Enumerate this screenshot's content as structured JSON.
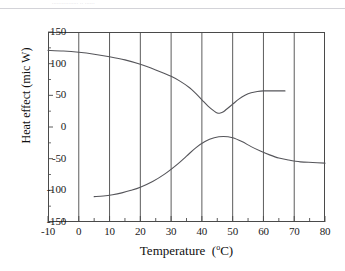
{
  "figure": {
    "scan_artifact_text": "................ ..  ......",
    "background_color": "#ffffff",
    "line_color": "#55555a",
    "axis_color": "#4a4a4a"
  },
  "chart_data": {
    "type": "line",
    "title": "",
    "xlabel_text": "Temperature",
    "xlabel_unit": "(oC)",
    "xlabel": "Temperature  (oC)",
    "ylabel": "Heat effect (mic W)",
    "xlim": [
      -10,
      80
    ],
    "ylim": [
      -150,
      150
    ],
    "xticks": [
      -10,
      0,
      10,
      20,
      30,
      40,
      50,
      60,
      70,
      80
    ],
    "xtick_labels": [
      "-10",
      "0",
      "10",
      "20",
      "30",
      "40",
      "50",
      "60",
      "70",
      "80"
    ],
    "yticks": [
      -150,
      -100,
      -50,
      0,
      50,
      100,
      150
    ],
    "ytick_labels": [
      "-150",
      "-100",
      "-50",
      "0",
      "50",
      "100",
      "150"
    ],
    "x_minor_tick_step": 5,
    "grid": "vertical gridlines at every major x tick",
    "grid_x": true,
    "grid_y": false,
    "legend": "none",
    "series": [
      {
        "name": "upper curve",
        "points": [
          [
            -10,
            121
          ],
          [
            -5,
            120
          ],
          [
            0,
            118
          ],
          [
            5,
            115
          ],
          [
            10,
            111
          ],
          [
            15,
            106
          ],
          [
            20,
            99
          ],
          [
            25,
            90
          ],
          [
            30,
            80
          ],
          [
            33,
            72
          ],
          [
            36,
            62
          ],
          [
            38,
            53
          ],
          [
            40,
            43
          ],
          [
            42,
            33
          ],
          [
            44,
            25
          ],
          [
            45,
            22
          ],
          [
            46,
            22
          ],
          [
            47,
            24
          ],
          [
            48,
            28
          ],
          [
            50,
            36
          ],
          [
            52,
            44
          ],
          [
            54,
            50
          ],
          [
            56,
            54
          ],
          [
            58,
            56
          ],
          [
            60,
            57
          ],
          [
            63,
            57
          ],
          [
            67,
            57
          ]
        ]
      },
      {
        "name": "lower curve",
        "points": [
          [
            5,
            -110
          ],
          [
            8,
            -109
          ],
          [
            11,
            -107
          ],
          [
            14,
            -104
          ],
          [
            17,
            -100
          ],
          [
            20,
            -95
          ],
          [
            24,
            -86
          ],
          [
            28,
            -74
          ],
          [
            32,
            -59
          ],
          [
            35,
            -46
          ],
          [
            38,
            -33
          ],
          [
            41,
            -23
          ],
          [
            44,
            -17
          ],
          [
            47,
            -15
          ],
          [
            50,
            -17
          ],
          [
            53,
            -23
          ],
          [
            56,
            -31
          ],
          [
            59,
            -38
          ],
          [
            62,
            -44
          ],
          [
            65,
            -49
          ],
          [
            68,
            -52
          ],
          [
            72,
            -55
          ],
          [
            76,
            -56
          ],
          [
            80,
            -57
          ]
        ]
      }
    ]
  }
}
